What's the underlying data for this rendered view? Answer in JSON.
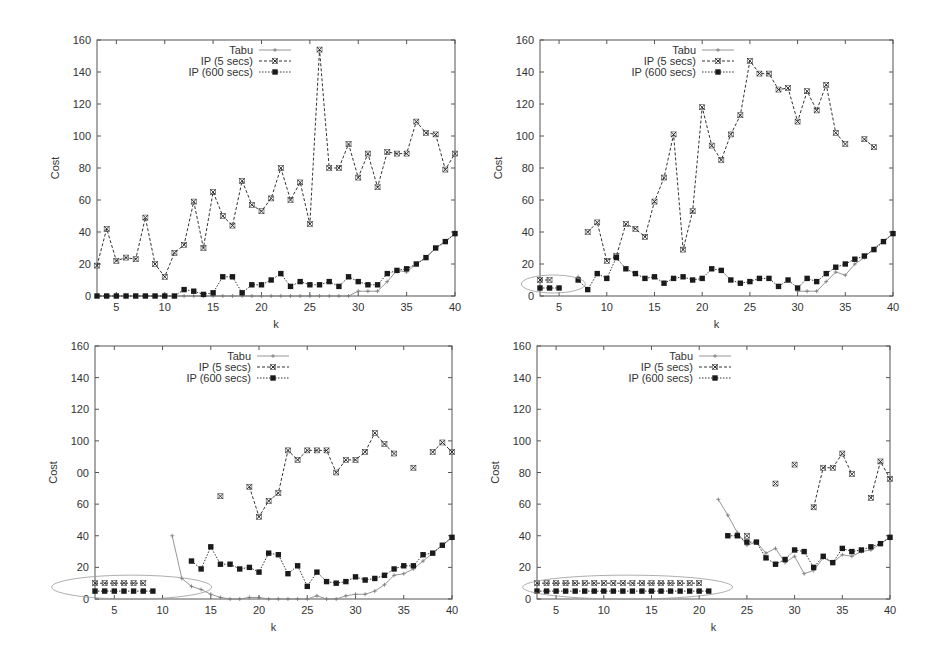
{
  "figure": {
    "layout": "2x2 grid of line plots",
    "legend_labels": [
      "Tabu",
      "IP (5 secs)",
      "IP (600 secs)"
    ]
  },
  "chart_data": [
    {
      "id": "top-left",
      "type": "line",
      "title": "",
      "xlabel": "k",
      "ylabel": "Cost",
      "xlim": [
        3,
        40
      ],
      "ylim": [
        0,
        160
      ],
      "x_ticks": [
        5,
        10,
        15,
        20,
        25,
        30,
        35,
        40
      ],
      "y_ticks": [
        0,
        20,
        40,
        60,
        80,
        100,
        120,
        140,
        160
      ],
      "y_tick_labels": [
        "0",
        "20",
        "40",
        "60",
        "80",
        "100",
        "120",
        "140",
        "160"
      ],
      "grid": false,
      "legend_position": "top-left inside",
      "x": [
        3,
        4,
        5,
        6,
        7,
        8,
        9,
        10,
        11,
        12,
        13,
        14,
        15,
        16,
        17,
        18,
        19,
        20,
        21,
        22,
        23,
        24,
        25,
        26,
        27,
        28,
        29,
        30,
        31,
        32,
        33,
        34,
        35,
        36,
        37,
        38,
        39,
        40
      ],
      "series": [
        {
          "name": "Tabu",
          "marker": "plus",
          "line": "solid",
          "values": [
            0,
            0,
            0,
            0,
            0,
            0,
            0,
            0,
            0,
            0,
            0,
            0,
            0,
            0,
            0,
            0,
            0,
            0,
            0,
            0,
            0,
            0,
            0,
            0,
            0,
            0,
            0,
            3,
            3,
            3,
            9,
            16,
            15,
            20,
            24,
            30,
            34,
            39
          ]
        },
        {
          "name": "IP (5 secs)",
          "marker": "x-box",
          "line": "dashed",
          "values": [
            19,
            42,
            22,
            24,
            23,
            49,
            20,
            12,
            27,
            32,
            59,
            30,
            65,
            50,
            44,
            72,
            57,
            53,
            61,
            80,
            60,
            71,
            45,
            154,
            80,
            80,
            95,
            74,
            89,
            68,
            90,
            89,
            89,
            109,
            102,
            101,
            79,
            89
          ]
        },
        {
          "name": "IP (600 secs)",
          "marker": "filled-square",
          "line": "dotted",
          "values": [
            0,
            0,
            0,
            0,
            0,
            0,
            0,
            0,
            0,
            4,
            3,
            1,
            2,
            12,
            12,
            2,
            7,
            7,
            10,
            14,
            6,
            9,
            7,
            7,
            9,
            6,
            12,
            9,
            7,
            7,
            14,
            16,
            17,
            20,
            24,
            30,
            34,
            39
          ]
        }
      ]
    },
    {
      "id": "top-right",
      "type": "line",
      "title": "",
      "xlabel": "k",
      "ylabel": "Cost",
      "xlim": [
        3,
        40
      ],
      "ylim": [
        0,
        160
      ],
      "x_ticks": [
        5,
        10,
        15,
        20,
        25,
        30,
        35,
        40
      ],
      "y_ticks": [
        0,
        20,
        40,
        60,
        80,
        100,
        120,
        140,
        160
      ],
      "y_tick_labels": [
        "0",
        "20",
        "40",
        "60",
        "80",
        "100",
        "120",
        "140",
        "160"
      ],
      "grid": false,
      "legend_position": "top-left inside",
      "annotation": "ellipse around k=3-5 points",
      "x": [
        3,
        4,
        5,
        6,
        7,
        8,
        9,
        10,
        11,
        12,
        13,
        14,
        15,
        16,
        17,
        18,
        19,
        20,
        21,
        22,
        23,
        24,
        25,
        26,
        27,
        28,
        29,
        30,
        31,
        32,
        33,
        34,
        35,
        36,
        37,
        38,
        39,
        40
      ],
      "series": [
        {
          "name": "Tabu",
          "marker": "plus",
          "line": "solid",
          "values": [
            null,
            null,
            null,
            null,
            12,
            null,
            null,
            null,
            null,
            null,
            null,
            null,
            null,
            null,
            null,
            null,
            null,
            null,
            null,
            null,
            null,
            null,
            null,
            null,
            null,
            null,
            null,
            3,
            3,
            3,
            9,
            15,
            13,
            20,
            24,
            30,
            34,
            39
          ]
        },
        {
          "name": "IP (5 secs)",
          "marker": "x-box",
          "line": "dashed",
          "values": [
            10,
            10,
            null,
            null,
            null,
            40,
            46,
            22,
            25,
            45,
            42,
            37,
            59,
            74,
            101,
            29,
            53,
            118,
            94,
            85,
            101,
            113,
            147,
            139,
            139,
            129,
            130,
            109,
            128,
            116,
            132,
            102,
            95,
            null,
            98,
            93,
            null,
            null
          ]
        },
        {
          "name": "IP (600 secs)",
          "marker": "filled-square",
          "line": "dotted",
          "values": [
            5,
            5,
            5,
            null,
            10,
            4,
            14,
            11,
            24,
            17,
            14,
            11,
            12,
            8,
            11,
            12,
            10,
            11,
            17,
            16,
            10,
            8,
            9,
            11,
            11,
            6,
            10,
            5,
            11,
            9,
            14,
            18,
            20,
            23,
            25,
            29,
            34,
            39
          ]
        }
      ]
    },
    {
      "id": "bottom-left",
      "type": "line",
      "title": "",
      "xlabel": "k",
      "ylabel": "Cost",
      "xlim": [
        3,
        40
      ],
      "ylim": [
        0,
        160
      ],
      "x_ticks": [
        5,
        10,
        15,
        20,
        25,
        30,
        35,
        40
      ],
      "y_ticks": [
        0,
        20,
        40,
        60,
        80,
        100,
        120,
        140,
        160
      ],
      "y_tick_labels": [
        "0",
        "20",
        "40",
        "60",
        "00",
        "100",
        "120",
        "140",
        "160"
      ],
      "grid": false,
      "legend_position": "top-left inside",
      "annotation": "ellipse around k=3-9 points",
      "x": [
        3,
        4,
        5,
        6,
        7,
        8,
        9,
        10,
        11,
        12,
        13,
        14,
        15,
        16,
        17,
        18,
        19,
        20,
        21,
        22,
        23,
        24,
        25,
        26,
        27,
        28,
        29,
        30,
        31,
        32,
        33,
        34,
        35,
        36,
        37,
        38,
        39,
        40
      ],
      "series": [
        {
          "name": "Tabu",
          "marker": "plus",
          "line": "solid",
          "values": [
            null,
            null,
            null,
            null,
            null,
            null,
            null,
            null,
            40,
            13,
            8,
            6,
            3,
            1,
            0,
            0,
            1,
            1,
            0,
            0,
            0,
            0,
            0,
            2,
            0,
            0,
            2,
            3,
            3,
            5,
            9,
            15,
            16,
            19,
            24,
            29,
            34,
            39
          ]
        },
        {
          "name": "IP (5 secs)",
          "marker": "x-box",
          "line": "dashed",
          "values": [
            10,
            10,
            10,
            10,
            10,
            10,
            null,
            null,
            null,
            null,
            null,
            null,
            null,
            65,
            null,
            null,
            71,
            52,
            62,
            67,
            94,
            88,
            94,
            94,
            94,
            80,
            88,
            88,
            93,
            105,
            98,
            92,
            null,
            83,
            null,
            93,
            99,
            93
          ]
        },
        {
          "name": "IP (600 secs)",
          "marker": "filled-square",
          "line": "dotted",
          "values": [
            5,
            5,
            5,
            5,
            5,
            5,
            5,
            null,
            null,
            null,
            24,
            19,
            33,
            22,
            22,
            19,
            20,
            17,
            29,
            28,
            16,
            21,
            8,
            17,
            11,
            10,
            11,
            14,
            12,
            13,
            15,
            19,
            21,
            21,
            28,
            29,
            34,
            39
          ]
        }
      ]
    },
    {
      "id": "bottom-right",
      "type": "line",
      "title": "",
      "xlabel": "k",
      "ylabel": "Cost",
      "xlim": [
        3,
        40
      ],
      "ylim": [
        0,
        160
      ],
      "x_ticks": [
        5,
        10,
        15,
        20,
        25,
        30,
        35,
        40
      ],
      "y_ticks": [
        0,
        20,
        40,
        60,
        80,
        100,
        120,
        140,
        160
      ],
      "y_tick_labels": [
        "0",
        "20",
        "40",
        "60",
        "80",
        "100",
        "120",
        "140",
        "160"
      ],
      "grid": false,
      "legend_position": "top-left inside",
      "annotation": "ellipse around k=3-21 points",
      "x": [
        3,
        4,
        5,
        6,
        7,
        8,
        9,
        10,
        11,
        12,
        13,
        14,
        15,
        16,
        17,
        18,
        19,
        20,
        21,
        22,
        23,
        24,
        25,
        26,
        27,
        28,
        29,
        30,
        31,
        32,
        33,
        34,
        35,
        36,
        37,
        38,
        39,
        40
      ],
      "series": [
        {
          "name": "Tabu",
          "marker": "plus",
          "line": "solid",
          "values": [
            null,
            null,
            null,
            null,
            null,
            null,
            null,
            null,
            null,
            null,
            null,
            null,
            null,
            null,
            null,
            null,
            null,
            null,
            null,
            63,
            53,
            42,
            34,
            36,
            29,
            32,
            23,
            27,
            16,
            18,
            26,
            23,
            28,
            27,
            30,
            31,
            35,
            39
          ]
        },
        {
          "name": "IP (5 secs)",
          "marker": "x-box",
          "line": "dashed",
          "values": [
            10,
            10,
            10,
            10,
            10,
            10,
            10,
            10,
            10,
            10,
            10,
            10,
            10,
            10,
            10,
            10,
            10,
            10,
            null,
            null,
            null,
            null,
            40,
            null,
            null,
            73,
            null,
            85,
            null,
            58,
            83,
            83,
            92,
            79,
            null,
            64,
            87,
            76
          ]
        },
        {
          "name": "IP (600 secs)",
          "marker": "filled-square",
          "line": "dotted",
          "values": [
            5,
            5,
            5,
            5,
            5,
            5,
            5,
            5,
            5,
            5,
            5,
            5,
            5,
            5,
            5,
            5,
            5,
            5,
            5,
            null,
            40,
            40,
            36,
            36,
            26,
            22,
            25,
            31,
            30,
            20,
            27,
            23,
            32,
            30,
            31,
            33,
            35,
            39
          ]
        }
      ]
    }
  ]
}
